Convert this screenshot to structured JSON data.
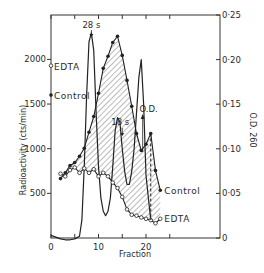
{
  "chart_data": {
    "type": "line",
    "title": "",
    "xlabel": "Fraction",
    "ylabel": "Radioactivity (cts/min)",
    "ylabel_right": "O.D. 260",
    "xlim": [
      0,
      30
    ],
    "ylim": [
      0,
      2500
    ],
    "ylim_right": [
      0,
      0.25
    ],
    "x_ticks": [
      0,
      5,
      10,
      15,
      20,
      25
    ],
    "x_tick_labels": [
      "0",
      "",
      "10",
      "",
      "20",
      ""
    ],
    "y_ticks": [
      500,
      1000,
      1500,
      2000
    ],
    "y_tick_labels": [
      "500",
      "1000",
      "1500",
      "2000"
    ],
    "y_right_ticks": [
      0,
      0.05,
      0.1,
      0.15,
      0.2,
      0.25
    ],
    "y_right_tick_labels": [
      "0",
      "0·05",
      "0·10",
      "0·15",
      "0·20",
      "0·25"
    ],
    "grid": false,
    "legend": "inline labels",
    "annotations": [
      {
        "text": "28 s",
        "x": 8.5,
        "points_to": "O.D. peak"
      },
      {
        "text": "18 s",
        "x": 15,
        "points_to": "O.D. peak"
      },
      {
        "text": "O.D.",
        "x": 19,
        "points_to": "O.D. curve"
      },
      {
        "text": "EDTA",
        "position": "left axis, ~1930 cts/min"
      },
      {
        "text": "Control",
        "position": "left axis, ~1600 cts/min"
      },
      {
        "text": "Control",
        "position": "end of control series"
      },
      {
        "text": "EDTA",
        "position": "end of EDTA series"
      }
    ],
    "shaded_region": "hatched area between Control and EDTA curves",
    "series": [
      {
        "name": "Control",
        "axis": "left",
        "marker": "filled circle",
        "x": [
          2,
          3,
          4,
          5,
          6,
          7,
          8,
          9,
          10,
          11,
          12,
          13,
          14,
          15,
          16,
          17,
          18,
          19,
          20,
          21,
          22,
          23
        ],
        "values": [
          665,
          730,
          810,
          845,
          915,
          1005,
          1185,
          1360,
          1620,
          1900,
          2035,
          2190,
          2260,
          2045,
          1765,
          1475,
          1170,
          980,
          1050,
          1170,
          755,
          535
        ]
      },
      {
        "name": "EDTA",
        "axis": "left",
        "marker": "open circle",
        "x": [
          2,
          3,
          4,
          5,
          6,
          7,
          8,
          9,
          10,
          11,
          12,
          13,
          14,
          15,
          16,
          17,
          18,
          19,
          20,
          21,
          22,
          23
        ],
        "values": [
          720,
          690,
          760,
          790,
          730,
          780,
          730,
          770,
          690,
          730,
          690,
          620,
          560,
          460,
          320,
          260,
          250,
          230,
          215,
          200,
          165,
          215
        ]
      },
      {
        "name": "O.D. 260",
        "axis": "right",
        "marker": "none",
        "x": [
          0,
          1,
          2,
          3,
          4,
          5,
          6,
          6.5,
          7,
          7.5,
          8,
          8.5,
          9,
          9.5,
          10,
          10.5,
          11,
          11.5,
          12,
          12.5,
          13,
          13.5,
          14,
          14.5,
          15,
          15.5,
          16,
          16.5,
          17,
          17.5,
          18,
          18.5,
          19,
          19.5,
          20,
          21
        ],
        "values": [
          0.003,
          0.001,
          -0.001,
          -0.002,
          -0.002,
          -0.001,
          0.002,
          0.02,
          0.08,
          0.16,
          0.22,
          0.23,
          0.21,
          0.14,
          0.08,
          0.045,
          0.03,
          0.025,
          0.03,
          0.045,
          0.08,
          0.12,
          0.135,
          0.13,
          0.1,
          0.075,
          0.06,
          0.06,
          0.075,
          0.1,
          0.14,
          0.18,
          0.2,
          0.15,
          0.07,
          0.02
        ]
      }
    ]
  }
}
